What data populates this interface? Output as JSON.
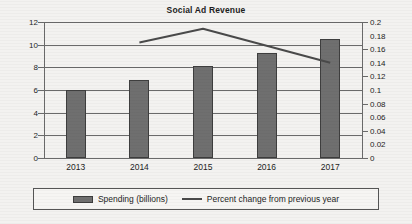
{
  "chart_data": {
    "type": "bar",
    "title": "Social Ad Revenue",
    "xlabel": "",
    "ylabel": "",
    "categories": [
      "2013",
      "2014",
      "2015",
      "2016",
      "2017"
    ],
    "grid": true,
    "legend_position": "bottom",
    "series": [
      {
        "name": "Spending (billions)",
        "type": "bar",
        "axis": "left",
        "color": "#6f6f6f",
        "values": [
          6.0,
          6.9,
          8.1,
          9.3,
          10.5
        ]
      },
      {
        "name": "Percent change from previous year",
        "type": "line",
        "axis": "right",
        "color": "#4a4a4a",
        "values": [
          null,
          0.17,
          0.19,
          0.165,
          0.14
        ]
      }
    ],
    "left_axis": {
      "min": 0,
      "max": 12,
      "step": 2,
      "ticks": [
        "12",
        "10",
        "8",
        "6",
        "4",
        "2",
        "0"
      ]
    },
    "right_axis": {
      "min": 0,
      "max": 0.2,
      "step": 0.02,
      "ticks": [
        "0.2",
        "0.18",
        "0.16",
        "0.14",
        "0.12",
        "0.1",
        "0.08",
        "0.06",
        "0.04",
        "0.02",
        "0"
      ]
    }
  },
  "legend": {
    "items": [
      {
        "label": "Spending (billions)",
        "marker": "bar-swatch"
      },
      {
        "label": "Percent change from previous year",
        "marker": "line-swatch"
      }
    ]
  }
}
